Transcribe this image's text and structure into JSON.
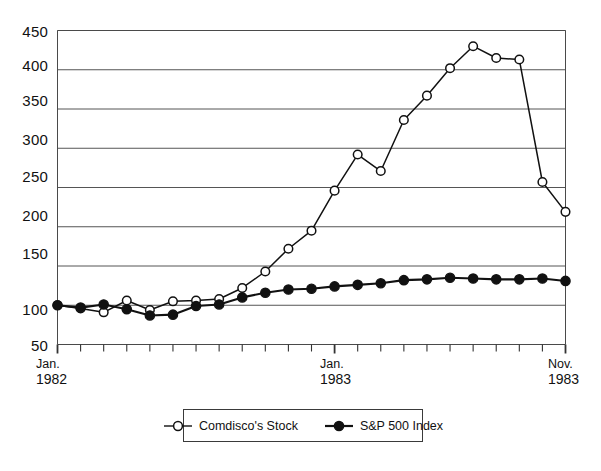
{
  "chart_data": {
    "type": "line",
    "title": "",
    "subtitle": "",
    "xlabel": "",
    "ylabel": "",
    "grid": true,
    "legend_position": "bottom-center",
    "ylim": [
      50,
      450
    ],
    "yticks": [
      50,
      100,
      150,
      200,
      250,
      300,
      350,
      400,
      450
    ],
    "ytick_labels": [
      "50",
      "100",
      "150",
      "200",
      "250",
      "300",
      "350",
      "400",
      "450"
    ],
    "x": [
      "Jan. 1982",
      "Feb. 1982",
      "Mar. 1982",
      "Apr. 1982",
      "May 1982",
      "Jun. 1982",
      "Jul. 1982",
      "Aug. 1982",
      "Sep. 1982",
      "Oct. 1982",
      "Nov. 1982",
      "Dec. 1982",
      "Jan. 1983",
      "Feb. 1983",
      "Mar. 1983",
      "Apr. 1983",
      "May 1983",
      "Jun. 1983",
      "Jul. 1983",
      "Aug. 1983",
      "Sep. 1983",
      "Oct. 1983",
      "Nov. 1983"
    ],
    "xtick_labels_shown": [
      {
        "index": 0,
        "line1": "Jan.",
        "line2": "1982"
      },
      {
        "index": 12,
        "line1": "Jan.",
        "line2": "1983"
      },
      {
        "index": 22,
        "line1": "Nov.",
        "line2": "1983"
      }
    ],
    "categories": [
      "Jan. 1982",
      "Feb. 1982",
      "Mar. 1982",
      "Apr. 1982",
      "May 1982",
      "Jun. 1982",
      "Jul. 1982",
      "Aug. 1982",
      "Sep. 1982",
      "Oct. 1982",
      "Nov. 1982",
      "Dec. 1982",
      "Jan. 1983",
      "Feb. 1983",
      "Mar. 1983",
      "Apr. 1983",
      "May 1983",
      "Jun. 1983",
      "Jul. 1983",
      "Aug. 1983",
      "Sep. 1983",
      "Oct. 1983",
      "Nov. 1983"
    ],
    "series": [
      {
        "name": "Comdisco's Stock",
        "marker": "open-circle",
        "color": "#111111",
        "fill": "#ffffff",
        "values": [
          100,
          96,
          91,
          106,
          94,
          105,
          106,
          108,
          122,
          143,
          172,
          195,
          246,
          292,
          271,
          336,
          367,
          402,
          430,
          415,
          413,
          257,
          219
        ]
      },
      {
        "name": "S&P 500 Index",
        "marker": "filled-circle",
        "color": "#111111",
        "fill": "#111111",
        "values": [
          100,
          97,
          101,
          95,
          87,
          88,
          99,
          101,
          110,
          116,
          120,
          121,
          124,
          126,
          128,
          132,
          133,
          135,
          134,
          133,
          133,
          134,
          131
        ]
      }
    ]
  },
  "legend": {
    "items": [
      {
        "label": "Comdisco's Stock",
        "marker": "open-circle"
      },
      {
        "label": "S&P 500 Index",
        "marker": "filled-circle"
      }
    ]
  },
  "axes": {
    "y_tick_labels": [
      "450",
      "400",
      "350",
      "300",
      "250",
      "200",
      "150",
      "100",
      "50"
    ],
    "x_tick_labels": [
      {
        "line1": "Jan.",
        "line2": "1982"
      },
      {
        "line1": "Jan.",
        "line2": "1983"
      },
      {
        "line1": "Nov.",
        "line2": "1983"
      }
    ]
  },
  "colors": {
    "line": "#111111",
    "grid": "#555555",
    "frame": "#4a4a4a",
    "background": "#ffffff"
  }
}
